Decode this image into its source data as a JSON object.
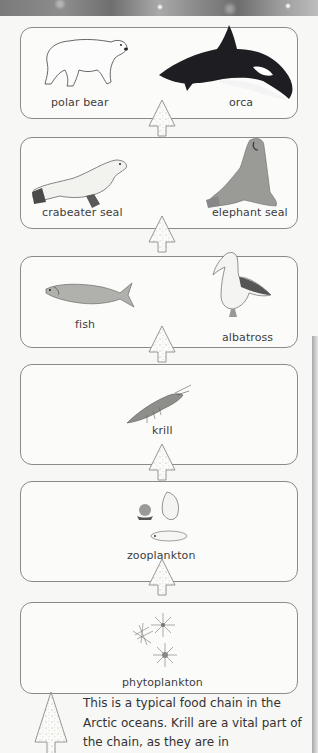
{
  "levels": [
    {
      "organisms": [
        {
          "name": "polar bear",
          "icon": "polar-bear-icon"
        },
        {
          "name": "orca",
          "icon": "orca-icon"
        }
      ]
    },
    {
      "organisms": [
        {
          "name": "crabeater seal",
          "icon": "crabeater-seal-icon"
        },
        {
          "name": "elephant seal",
          "icon": "elephant-seal-icon"
        }
      ]
    },
    {
      "organisms": [
        {
          "name": "fish",
          "icon": "fish-icon"
        },
        {
          "name": "albatross",
          "icon": "albatross-icon"
        }
      ]
    },
    {
      "organisms": [
        {
          "name": "krill",
          "icon": "krill-icon"
        }
      ]
    },
    {
      "organisms": [
        {
          "name": "zooplankton",
          "icon": "zooplankton-icon"
        }
      ]
    },
    {
      "organisms": [
        {
          "name": "phytoplankton",
          "icon": "phytoplankton-icon"
        }
      ]
    }
  ],
  "arrow_icon": "up-arrow-speckled-icon",
  "caption": "This is a typical food chain in the Arctic oceans. Krill are a vital part of the chain, as they are in",
  "colors": {
    "box_border": "#8a8a8a",
    "background": "#f7f7f5",
    "text": "#3a3a3a"
  }
}
